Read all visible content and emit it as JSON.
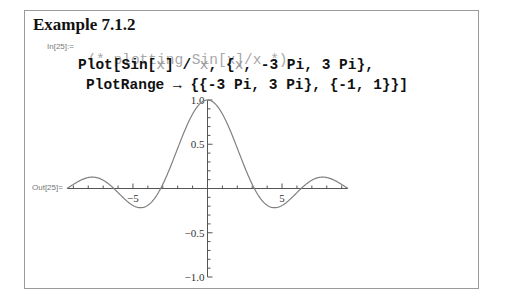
{
  "title": "Example 7.1.2",
  "input": {
    "label": "In[25]:=",
    "comment": "(* plotting Sin[x]/x *)",
    "line2_parts": [
      "Plot[Sin[",
      "x",
      "] / ",
      "x",
      ", {",
      "x",
      ", -3 Pi, 3 Pi},"
    ],
    "line3": "PlotRange → {{-3 Pi, 3 Pi}, {-1, 1}}]"
  },
  "output": {
    "label": "Out[25]="
  },
  "chart_data": {
    "type": "line",
    "title": "",
    "function": "Sin[x]/x",
    "xlabel": "",
    "ylabel": "",
    "xlim": [
      -9.42478,
      9.42478
    ],
    "ylim": [
      -1,
      1
    ],
    "x_tick_labels": [
      "-5",
      "5"
    ],
    "x_ticks": [
      -5,
      5
    ],
    "y_tick_labels": [
      "1.0",
      "0.5",
      "-0.5",
      "-1.0"
    ],
    "y_ticks": [
      1.0,
      0.5,
      -0.5,
      -1.0
    ],
    "grid": false,
    "series": [
      {
        "name": "Sin[x]/x",
        "x": [
          -9.42,
          -8,
          -7.73,
          -6.28,
          -5,
          -4.49,
          -3.14,
          -2,
          -1,
          0,
          1,
          2,
          3.14,
          4.49,
          5,
          6.28,
          7.73,
          8,
          9.42
        ],
        "values": [
          0.0,
          0.124,
          0.128,
          0.0,
          -0.192,
          -0.217,
          0.0,
          0.455,
          0.841,
          1.0,
          0.841,
          0.455,
          0.0,
          -0.217,
          -0.192,
          0.0,
          0.128,
          0.124,
          0.0
        ]
      }
    ],
    "color": "#808080"
  }
}
